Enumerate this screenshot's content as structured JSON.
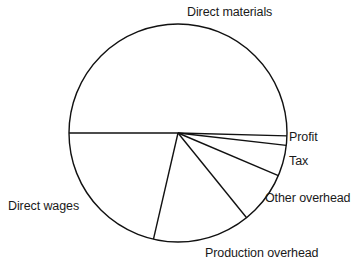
{
  "chart_data": {
    "type": "pie",
    "title": "",
    "xlabel": "",
    "ylabel": "",
    "legend_position": "none",
    "grid": false,
    "label_placement": "outside-callout",
    "start_angle_deg": 180,
    "direction": "clockwise",
    "categories": [
      "Direct materials",
      "Profit",
      "Tax",
      "Other overhead",
      "Production overhead",
      "Direct wages"
    ],
    "values": [
      50.3,
      1.4,
      4.6,
      7.8,
      14.4,
      21.5
    ],
    "units": "percent",
    "slices": [
      {
        "label": "Direct materials",
        "value": 50.3,
        "start_angle_deg": 180.0,
        "end_angle_deg": 361.5,
        "sweep_deg": 181.5
      },
      {
        "label": "Profit",
        "value": 1.4,
        "start_angle_deg": 1.5,
        "end_angle_deg": 6.5,
        "sweep_deg": 5.0
      },
      {
        "label": "Tax",
        "value": 4.6,
        "start_angle_deg": 6.5,
        "end_angle_deg": 23.0,
        "sweep_deg": 16.5
      },
      {
        "label": "Other overhead",
        "value": 7.8,
        "start_angle_deg": 23.0,
        "end_angle_deg": 51.0,
        "sweep_deg": 28.0
      },
      {
        "label": "Production overhead",
        "value": 14.4,
        "start_angle_deg": 51.0,
        "end_angle_deg": 103.0,
        "sweep_deg": 52.0
      },
      {
        "label": "Direct wages",
        "value": 21.5,
        "start_angle_deg": 103.0,
        "end_angle_deg": 180.0,
        "sweep_deg": 77.0
      }
    ]
  },
  "labels": {
    "direct_materials": "Direct materials",
    "profit": "Profit",
    "tax": "Tax",
    "other_overhead": "Other overhead",
    "production_overhead": "Production overhead",
    "direct_wages": "Direct wages"
  },
  "clipped_header": {
    "text": "",
    "note": "top row of image is a faint, cropped line of text; no characters legible"
  },
  "style": {
    "stroke_color": "#111111",
    "fill_color": "#ffffff",
    "text_color": "#1a1a1a",
    "background": "#ffffff"
  }
}
